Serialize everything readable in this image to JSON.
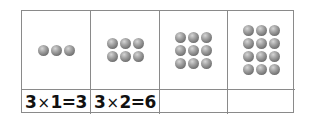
{
  "table": {
    "columns": [
      {
        "dots": {
          "rows": 1,
          "cols": 3,
          "count": 3
        },
        "label": {
          "a": "3",
          "op": "×",
          "b": "1",
          "eq": "=",
          "result": "3"
        }
      },
      {
        "dots": {
          "rows": 2,
          "cols": 3,
          "count": 6
        },
        "label": {
          "a": "3",
          "op": "×",
          "b": "2",
          "eq": "=",
          "result": "6"
        }
      },
      {
        "dots": {
          "rows": 3,
          "cols": 3,
          "count": 9
        },
        "label": null
      },
      {
        "dots": {
          "rows": 4,
          "cols": 3,
          "count": 12
        },
        "label": null
      }
    ]
  },
  "colors": {
    "border": "#8a8a8a",
    "dot": "#8c8c8c",
    "text": "#111111"
  }
}
